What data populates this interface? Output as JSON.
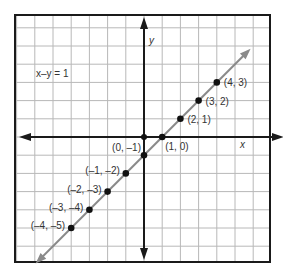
{
  "chart_data": {
    "type": "line",
    "title": "",
    "equation": "x–y = 1",
    "xlabel": "x",
    "ylabel": "y",
    "xlim": [
      -7,
      7
    ],
    "ylim": [
      -7,
      7
    ],
    "grid": true,
    "legend_position": "none",
    "series": [
      {
        "name": "x–y = 1",
        "type": "line-with-arrows",
        "color": "#8a8a8a",
        "points": [
          {
            "x": -4,
            "y": -5,
            "label": "(–4, –5)"
          },
          {
            "x": -3,
            "y": -4,
            "label": "(–3, –4)"
          },
          {
            "x": -2,
            "y": -3,
            "label": "(–2, –3)"
          },
          {
            "x": -1,
            "y": -2,
            "label": "(–1, –2)"
          },
          {
            "x": 0,
            "y": -1,
            "label": "(0, –1)"
          },
          {
            "x": 1,
            "y": 0,
            "label": "(1, 0)"
          },
          {
            "x": 2,
            "y": 1,
            "label": "(2, 1)"
          },
          {
            "x": 3,
            "y": 2,
            "label": "(3, 2)"
          },
          {
            "x": 4,
            "y": 3,
            "label": "(4, 3)"
          }
        ]
      }
    ],
    "annotations": [
      {
        "text": "x–y = 1",
        "x": -4.5,
        "y": 3
      }
    ]
  },
  "colors": {
    "grid": "#b8b8b8",
    "axis": "#1a1a1a",
    "border": "#1a1a1a",
    "line": "#8a8a8a",
    "point": "#111111",
    "text": "#333333"
  }
}
